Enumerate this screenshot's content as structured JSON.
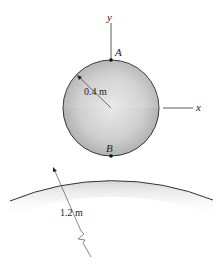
{
  "diagram": {
    "axes": {
      "y_label": "y",
      "x_label": "x"
    },
    "points": {
      "A": "A",
      "B": "B"
    },
    "small_disk": {
      "radius_label": "0.4 m"
    },
    "large_surface": {
      "radius_label": "1.2 m"
    },
    "colors": {
      "disk_fill_light": "#f2f2f2",
      "disk_fill_dark": "#a8a8a8",
      "outline": "#333333",
      "shadow": "#dcdcdc"
    }
  }
}
